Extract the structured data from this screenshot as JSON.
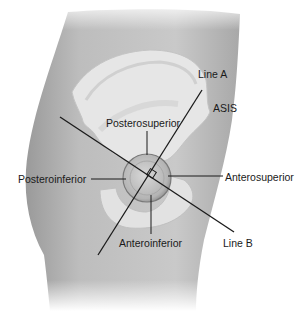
{
  "figure": {
    "labels": {
      "line_a": "Line A",
      "asis": "ASIS",
      "posterosuperior": "Posterosuperior",
      "posteroinferior": "Posteroinferior",
      "anterosuperior": "Anterosuperior",
      "anteroinferior": "Anteroinferior",
      "line_b": "Line B"
    },
    "colors": {
      "skin": "#b8b8b8",
      "skin_dark": "#8f8f8f",
      "bone": "#e4e4e4",
      "line": "#1a1a1a",
      "background": "#ffffff"
    }
  }
}
